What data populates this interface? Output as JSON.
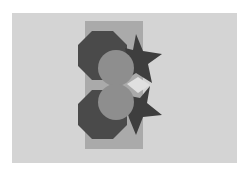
{
  "scene": {
    "background": "#ffffff",
    "panel_color": "#d4d4d4",
    "rect_color": "#aaaaaa",
    "octagon_color": "#4a4a4a",
    "star_color": "#3e3e3e",
    "circle_color": "#8e8e8e",
    "gap_color": "#e0e0e0"
  },
  "shapes": [
    {
      "type": "rectangle",
      "name": "backing-rectangle"
    },
    {
      "type": "octagon",
      "name": "top-octagon"
    },
    {
      "type": "octagon",
      "name": "bottom-octagon"
    },
    {
      "type": "star",
      "name": "top-star"
    },
    {
      "type": "star",
      "name": "bottom-star"
    },
    {
      "type": "circle",
      "name": "top-circle"
    },
    {
      "type": "circle",
      "name": "bottom-circle"
    }
  ]
}
